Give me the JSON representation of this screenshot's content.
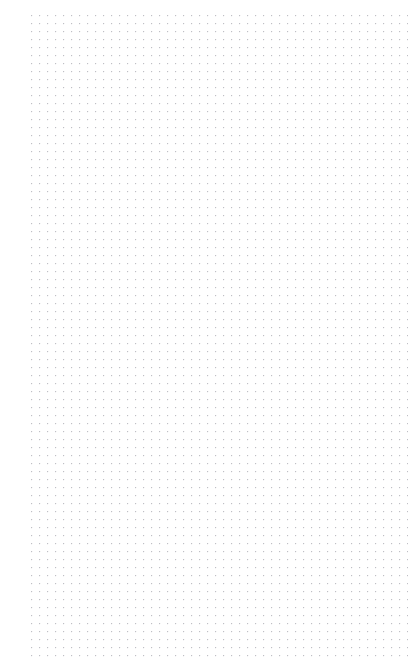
{
  "page": {
    "width": 412,
    "height": 672,
    "background_color": "#ffffff"
  },
  "dot_grid": {
    "pattern_name": "dot-grid-paper",
    "dot_color": "#c8c8cc",
    "dot_color_secondary": "#b9b9c0",
    "dot_size_px": 1,
    "spacing_x_px": 8,
    "spacing_y_px": 8,
    "origin_x_px": 31,
    "origin_y_px": 15,
    "last_dot_x_px": 400,
    "last_dot_y_px": 655,
    "margin_left_px": 31,
    "margin_right_px": 12,
    "margin_top_px": 14,
    "margin_bottom_px": 17,
    "columns": 47,
    "rows": 81
  }
}
